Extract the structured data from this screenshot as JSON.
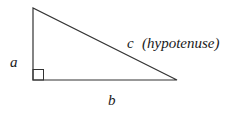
{
  "diagram": {
    "labels": {
      "a": "a",
      "b": "b",
      "c": "c",
      "hypotenuse": "(hypotenuse)"
    },
    "vertices": {
      "top": [
        33,
        8
      ],
      "right_angle": [
        33,
        80
      ],
      "right": [
        177,
        80
      ]
    },
    "right_angle_marker_size": 11,
    "stroke_color": "#333333"
  }
}
